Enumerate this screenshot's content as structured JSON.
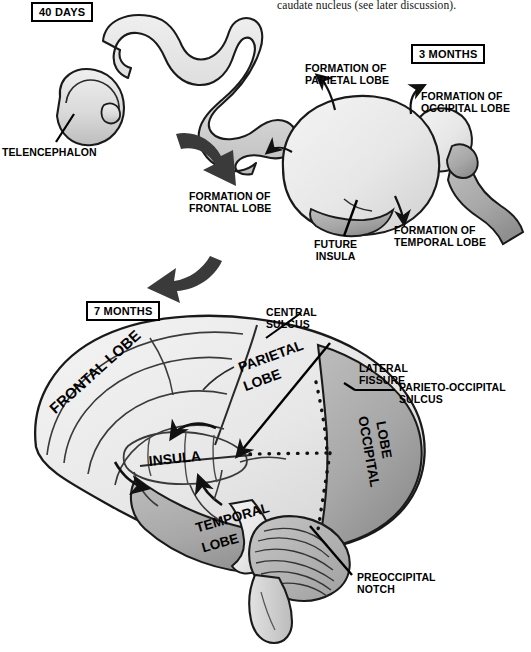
{
  "page": {
    "width": 531,
    "height": 652,
    "body_text": "caudate nucleus (see later discussion).",
    "background": "#ffffff"
  },
  "colors": {
    "outline": "#1a1a1a",
    "brain_light": "#e9e9e9",
    "brain_mid": "#d2d2d2",
    "brain_dark": "#a9a9a9",
    "cerebellum": "#b4b4b4",
    "arrow_block": "#3a3a3a",
    "text": "#000000"
  },
  "stages": [
    {
      "id": "stage-40-days",
      "label": "40 DAYS",
      "x": 31,
      "y": 2
    },
    {
      "id": "stage-3-months",
      "label": "3 MONTHS",
      "x": 411,
      "y": 44
    },
    {
      "id": "stage-7-months",
      "label": "7 MONTHS",
      "x": 86,
      "y": 301
    }
  ],
  "labels": {
    "telencephalon": "TELENCEPHALON",
    "formation_parietal": "FORMATION OF\nPARIETAL LOBE",
    "formation_occipital": "FORMATION OF\nOCCIPITAL LOBE",
    "formation_frontal": "FORMATION OF\nFRONTAL LOBE",
    "formation_temporal": "FORMATION OF\nTEMPORAL LOBE",
    "future_insula": "FUTURE\nINSULA",
    "central_sulcus": "CENTRAL\nSULCUS",
    "lateral_fissure": "LATERAL\nFISSURE",
    "parieto_occipital_sulcus": "PARIETO-OCCIPITAL\nSULCUS",
    "preoccipital_notch": "PREOCCIPITAL\nNOTCH",
    "frontal_lobe": "FRONTAL LOBE",
    "parietal_lobe_l1": "PARIETAL",
    "parietal_lobe_l2": "LOBE",
    "occipital_lobe_l1": "OCCIPITAL",
    "occipital_lobe_l2": "LOBE",
    "temporal_lobe_l1": "TEMPORAL",
    "temporal_lobe_l2": "LOBE",
    "insula": "INSULA"
  }
}
